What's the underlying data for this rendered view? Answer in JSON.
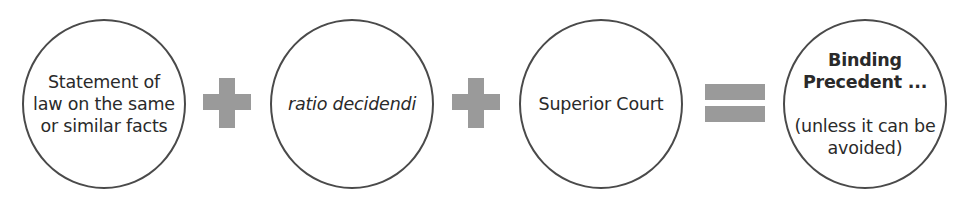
{
  "diagram": {
    "terms": [
      {
        "lines": [
          "Statement of",
          "law on the same",
          "or similar facts"
        ]
      },
      {
        "text": "ratio decidendi",
        "style": "italic"
      },
      {
        "text": "Superior Court"
      }
    ],
    "operators": {
      "plus": "+",
      "equals": "="
    },
    "result": {
      "title_lines": [
        "Binding",
        "Precedent ..."
      ],
      "note_lines": [
        "(unless it can be",
        "avoided)"
      ]
    },
    "colors": {
      "circle_border": "#4a4a4a",
      "operator_fill": "#9a9a9a",
      "text": "#2a2a2a"
    }
  }
}
